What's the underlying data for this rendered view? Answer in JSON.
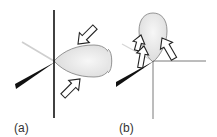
{
  "figure": {
    "panels": [
      {
        "id": "a",
        "label": "(a)",
        "description": "Lobe extending horizontally from a vertical plane, with two hollow arrows pointing toward the lobe"
      },
      {
        "id": "b",
        "label": "(b)",
        "description": "Lobe extending vertically above a horizontal plane, with hollow arrows pointing up along the lobe"
      }
    ],
    "colors": {
      "line": "#111111",
      "lobe_fill": "#e6e6e6",
      "lobe_stroke": "#8a8a8a",
      "arrow_stroke": "#222222",
      "arrow_fill": "#ffffff",
      "faint_line": "#c8c8c8",
      "thin_line": "#7a7a7a"
    }
  }
}
